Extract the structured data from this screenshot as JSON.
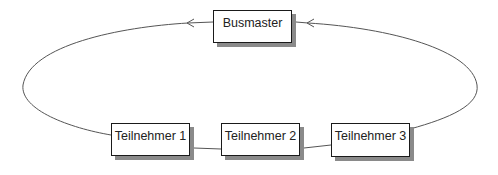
{
  "diagram": {
    "type": "bus-ring",
    "colors": {
      "line": "#555555",
      "border": "#1a1a1a",
      "shadow": "#8a8a8a",
      "background": "#ffffff"
    },
    "nodes": [
      {
        "id": "busmaster",
        "label": "Busmaster",
        "x": 213,
        "y": 10,
        "w": 79,
        "h": 33
      },
      {
        "id": "teilnehmer-1",
        "label": "Teilnehmer 1",
        "x": 111,
        "y": 123,
        "w": 79,
        "h": 33
      },
      {
        "id": "teilnehmer-2",
        "label": "Teilnehmer 2",
        "x": 221,
        "y": 123,
        "w": 79,
        "h": 33
      },
      {
        "id": "teilnehmer-3",
        "label": "Teilnehmer 3",
        "x": 331,
        "y": 123,
        "w": 79,
        "h": 34
      }
    ],
    "edges": [
      {
        "from": "teilnehmer-1",
        "to": "busmaster",
        "arrow": "into-busmaster-left"
      },
      {
        "from": "teilnehmer-1",
        "to": "teilnehmer-2"
      },
      {
        "from": "teilnehmer-2",
        "to": "teilnehmer-3"
      },
      {
        "from": "teilnehmer-3",
        "to": "busmaster",
        "arrow": "into-busmaster-right"
      }
    ]
  }
}
